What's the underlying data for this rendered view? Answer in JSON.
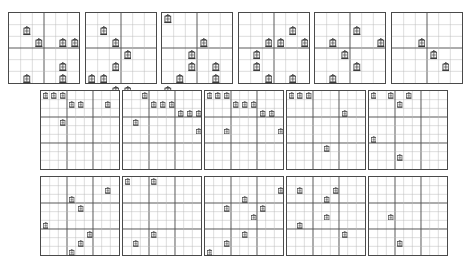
{
  "sheet": {
    "title": "puzzle-grid-sheet",
    "background_color": "#ffffff",
    "grid_line_color": "#b8b8b8",
    "block_line_color": "#555555",
    "border_color": "#4a4a4a",
    "piece_color": "#3a3a3a",
    "piece_fill": "#f2f2f2",
    "piece_icon": "lantern-icon"
  },
  "rows": [
    {
      "name": "top-row",
      "x": 8,
      "y": 12,
      "gap": 4.5,
      "grid_size": 72,
      "cells": 6,
      "block": 3,
      "grids": [
        {
          "label": "grid-1",
          "pieces": [
            [
              1,
              1
            ],
            [
              2,
              2
            ],
            [
              2,
              4
            ],
            [
              2,
              5
            ],
            [
              4,
              4
            ],
            [
              5,
              1
            ],
            [
              5,
              4
            ]
          ]
        },
        {
          "label": "grid-2",
          "pieces": [
            [
              1,
              1
            ],
            [
              2,
              2
            ],
            [
              3,
              3
            ],
            [
              4,
              2
            ],
            [
              5,
              0
            ],
            [
              5,
              1
            ],
            [
              6,
              2
            ],
            [
              6,
              3
            ]
          ]
        },
        {
          "label": "grid-3",
          "pieces": [
            [
              0,
              0
            ],
            [
              2,
              3
            ],
            [
              3,
              2
            ],
            [
              4,
              4
            ],
            [
              4,
              2
            ],
            [
              5,
              1
            ],
            [
              5,
              4
            ],
            [
              6,
              0
            ]
          ]
        },
        {
          "label": "grid-4",
          "pieces": [
            [
              1,
              4
            ],
            [
              2,
              5
            ],
            [
              2,
              2
            ],
            [
              2,
              3
            ],
            [
              3,
              1
            ],
            [
              4,
              1
            ],
            [
              5,
              2
            ],
            [
              5,
              4
            ]
          ]
        },
        {
          "label": "grid-5",
          "pieces": [
            [
              1,
              3
            ],
            [
              2,
              1
            ],
            [
              2,
              5
            ],
            [
              3,
              2
            ],
            [
              4,
              3
            ],
            [
              5,
              1
            ]
          ]
        },
        {
          "label": "grid-6",
          "pieces": [
            [
              2,
              2
            ],
            [
              3,
              3
            ],
            [
              4,
              4
            ]
          ]
        }
      ]
    },
    {
      "name": "middle-row",
      "x": 40,
      "y": 90,
      "gap": 2,
      "grid_size": 80,
      "cells": 9,
      "block": 3,
      "grids": [
        {
          "label": "grid-7",
          "pieces": [
            [
              0,
              0
            ],
            [
              0,
              1
            ],
            [
              0,
              2
            ],
            [
              1,
              3
            ],
            [
              1,
              4
            ],
            [
              1,
              7
            ],
            [
              3,
              2
            ]
          ]
        },
        {
          "label": "grid-8",
          "pieces": [
            [
              0,
              2
            ],
            [
              1,
              3
            ],
            [
              1,
              4
            ],
            [
              1,
              5
            ],
            [
              2,
              6
            ],
            [
              2,
              7
            ],
            [
              2,
              8
            ],
            [
              3,
              1
            ],
            [
              4,
              8
            ]
          ]
        },
        {
          "label": "grid-9",
          "pieces": [
            [
              0,
              0
            ],
            [
              0,
              1
            ],
            [
              0,
              2
            ],
            [
              1,
              3
            ],
            [
              1,
              4
            ],
            [
              1,
              5
            ],
            [
              2,
              6
            ],
            [
              2,
              7
            ],
            [
              4,
              2
            ],
            [
              4,
              8
            ]
          ]
        },
        {
          "label": "grid-10",
          "pieces": [
            [
              0,
              0
            ],
            [
              0,
              1
            ],
            [
              0,
              2
            ],
            [
              2,
              6
            ],
            [
              6,
              4
            ]
          ]
        },
        {
          "label": "grid-11",
          "pieces": [
            [
              0,
              0
            ],
            [
              0,
              2
            ],
            [
              0,
              4
            ],
            [
              1,
              3
            ],
            [
              5,
              0
            ],
            [
              7,
              3
            ]
          ]
        }
      ]
    },
    {
      "name": "bottom-row",
      "x": 40,
      "y": 176,
      "gap": 2,
      "grid_size": 80,
      "cells": 9,
      "block": 3,
      "grids": [
        {
          "label": "grid-12",
          "pieces": [
            [
              1,
              7
            ],
            [
              2,
              3
            ],
            [
              3,
              4
            ],
            [
              5,
              0
            ],
            [
              6,
              5
            ],
            [
              7,
              4
            ],
            [
              8,
              3
            ]
          ]
        },
        {
          "label": "grid-13",
          "pieces": [
            [
              0,
              0
            ],
            [
              0,
              3
            ],
            [
              6,
              3
            ],
            [
              7,
              1
            ]
          ]
        },
        {
          "label": "grid-14",
          "pieces": [
            [
              1,
              8
            ],
            [
              2,
              4
            ],
            [
              3,
              2
            ],
            [
              3,
              6
            ],
            [
              4,
              5
            ],
            [
              6,
              4
            ],
            [
              7,
              2
            ],
            [
              8,
              0
            ]
          ]
        },
        {
          "label": "grid-15",
          "pieces": [
            [
              1,
              1
            ],
            [
              1,
              5
            ],
            [
              2,
              4
            ],
            [
              4,
              4
            ],
            [
              5,
              1
            ],
            [
              6,
              6
            ]
          ]
        },
        {
          "label": "grid-16",
          "pieces": [
            [
              4,
              2
            ],
            [
              7,
              3
            ]
          ]
        }
      ]
    }
  ]
}
